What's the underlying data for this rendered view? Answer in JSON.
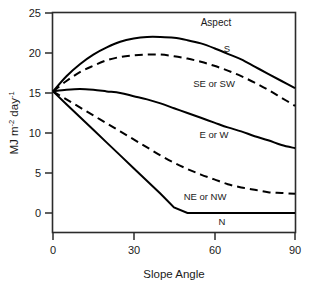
{
  "chart_data": {
    "type": "line",
    "title": "",
    "xlabel": "Slope Angle",
    "ylabel": "MJ m-2 day-1",
    "ylabel_parts": {
      "base1": "MJ m",
      "sup1": "-2",
      "base2": " day",
      "sup2": "-1"
    },
    "legend_title": "Aspect",
    "legend_position": "inline-curve-labels",
    "grid": false,
    "xlim": [
      0,
      90
    ],
    "ylim": [
      0,
      25
    ],
    "xticks": [
      "0",
      "30",
      "60",
      "90"
    ],
    "xtick_values": [
      0,
      30,
      60,
      90
    ],
    "yticks": [
      "0",
      "5",
      "10",
      "15",
      "20",
      "25"
    ],
    "ytick_values": [
      0,
      5,
      10,
      15,
      20,
      25
    ],
    "x": [
      0,
      5,
      10,
      15,
      20,
      25,
      30,
      35,
      40,
      45,
      50,
      55,
      60,
      65,
      70,
      75,
      80,
      85,
      90
    ],
    "series": [
      {
        "name": "S",
        "style": "solid",
        "color": "#000000",
        "label": "S",
        "values": [
          15.2,
          17.1,
          18.6,
          19.8,
          20.7,
          21.4,
          21.8,
          22.0,
          22.0,
          21.9,
          21.6,
          21.2,
          20.6,
          19.9,
          19.2,
          18.3,
          17.4,
          16.5,
          15.6
        ]
      },
      {
        "name": "SE or SW",
        "style": "dashed",
        "color": "#000000",
        "label": "SE or SW",
        "values": [
          15.2,
          16.5,
          17.6,
          18.4,
          19.1,
          19.5,
          19.7,
          19.8,
          19.8,
          19.6,
          19.3,
          18.9,
          18.4,
          17.8,
          17.1,
          16.3,
          15.4,
          14.4,
          13.4
        ]
      },
      {
        "name": "E or W",
        "style": "solid",
        "color": "#000000",
        "label": "E or W",
        "values": [
          15.2,
          15.4,
          15.5,
          15.4,
          15.2,
          15.0,
          14.6,
          14.2,
          13.7,
          13.1,
          12.5,
          11.9,
          11.3,
          10.7,
          10.2,
          9.6,
          9.1,
          8.5,
          8.1
        ]
      },
      {
        "name": "NE or NW",
        "style": "dashed",
        "color": "#000000",
        "label": "NE or NW",
        "values": [
          15.2,
          14.2,
          13.2,
          12.2,
          11.2,
          10.2,
          9.2,
          8.2,
          7.2,
          6.3,
          5.5,
          4.8,
          4.2,
          3.6,
          3.2,
          2.9,
          2.6,
          2.5,
          2.4
        ]
      },
      {
        "name": "N",
        "style": "solid",
        "color": "#000000",
        "label": "N",
        "values": [
          15.2,
          13.6,
          12.0,
          10.4,
          8.8,
          7.2,
          5.6,
          4.0,
          2.4,
          0.7,
          0.0,
          0.0,
          0.0,
          0.0,
          0.0,
          0.0,
          0.0,
          0.0,
          0.0
        ]
      }
    ],
    "annotations": [
      {
        "text": "Aspect",
        "x": 48,
        "y": 24.2
      },
      {
        "text": "S",
        "x": 55,
        "y": 20.9
      },
      {
        "text": "SE or SW",
        "x": 49,
        "y": 16.7
      },
      {
        "text": "E or W",
        "x": 50,
        "y": 10.5
      },
      {
        "text": "NE or NW",
        "x": 45,
        "y": 2.9
      },
      {
        "text": "N",
        "x": 54,
        "y": -1.2
      }
    ]
  }
}
